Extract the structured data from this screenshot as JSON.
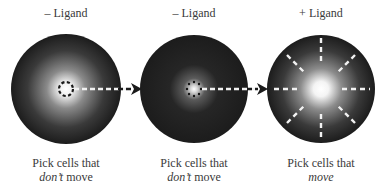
{
  "panels": [
    {
      "title": "– Ligand",
      "caption_line1": "Pick cells that",
      "caption_emph": "don’t",
      "caption_rest": " move",
      "center": [
        66,
        89
      ],
      "radius": 55,
      "glow": "bright-center",
      "cells": "ring-of-dashes"
    },
    {
      "title": "– Ligand",
      "caption_line1": "Pick cells that",
      "caption_emph": "don’t",
      "caption_rest": " move",
      "center": [
        194,
        89
      ],
      "radius": 54,
      "glow": "small-center",
      "cells": "ring-of-dots"
    },
    {
      "title": "+ Ligand",
      "caption_line1": "Pick cells that",
      "caption_emph": "move",
      "caption_rest": "",
      "center": [
        321,
        89
      ],
      "radius": 54,
      "glow": "bright-center",
      "cells": "radial-dashes"
    }
  ],
  "colors": {
    "dish_dark": "#1e1e1e",
    "dish_mid": "#6a6a6a",
    "glow": "#ffffff",
    "text": "#3a3a3a",
    "dashes": "#f2f2f2",
    "arrowhead": "#1a1a1a"
  }
}
